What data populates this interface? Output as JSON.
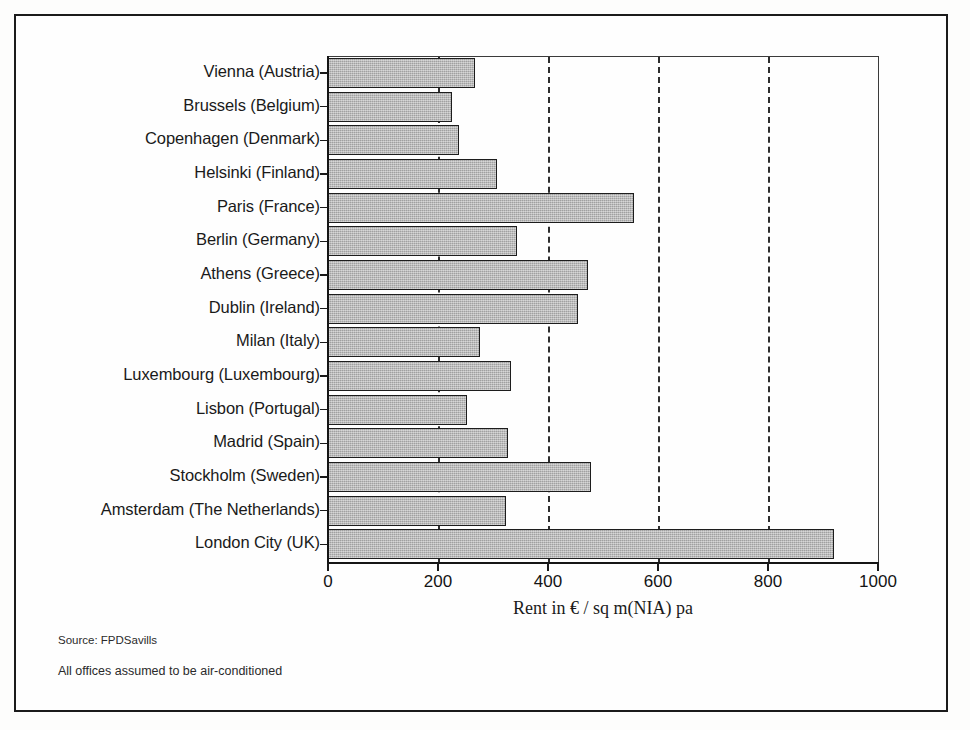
{
  "chart_data": {
    "type": "bar",
    "orientation": "horizontal",
    "title": "",
    "xlabel": "Rent in € / sq m(NIA) pa",
    "ylabel": "",
    "xlim": [
      0,
      1000
    ],
    "xticks": [
      0,
      200,
      400,
      600,
      800,
      1000
    ],
    "grid": "vertical-dashed",
    "legend": "none",
    "categories": [
      "Vienna (Austria)",
      "Brussels (Belgium)",
      "Copenhagen (Denmark)",
      "Helsinki (Finland)",
      "Paris (France)",
      "Berlin (Germany)",
      "Athens (Greece)",
      "Dublin (Ireland)",
      "Milan (Italy)",
      "Luxembourg (Luxembourg)",
      "Lisbon (Portugal)",
      "Madrid (Spain)",
      "Stockholm (Sweden)",
      "Amsterdam (The Netherlands)",
      "London City (UK)"
    ],
    "values": [
      268,
      225,
      238,
      308,
      556,
      343,
      473,
      455,
      277,
      332,
      252,
      328,
      478,
      323,
      920
    ],
    "bar_fill_color": "#b4b4b4",
    "bar_edge_color": "#1d1d1d",
    "gridline_color": "#2d2d2d",
    "axis_color": "#151515"
  },
  "notes": {
    "source": "Source: FPDSavills",
    "assumption": "All offices assumed to be air-conditioned"
  }
}
